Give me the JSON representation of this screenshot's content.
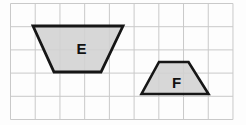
{
  "figure": {
    "background_color": "#fdfdfd",
    "width": 246,
    "height": 125,
    "grid": {
      "line_color": "#c9c9c9",
      "line_width": 1,
      "x0": 10.5,
      "y0": 3.5,
      "cols": 9,
      "rows": 5,
      "cell_width": 24.72,
      "cell_height": 23.2
    },
    "label_color": "#121212",
    "label_font_size": 15,
    "shapes": [
      {
        "id": "trapezoid-E",
        "label": "E",
        "points": "33,26 123,26 101,72 54,72",
        "label_x": 81.5,
        "label_y": 54,
        "fill": "#d2d2d2",
        "fill_opacity": 0.88,
        "stroke": "#161616",
        "stroke_width": 2.8
      },
      {
        "id": "trapezoid-F",
        "label": "F",
        "points": "159,62 188.5,62 208.5,94 141.5,94",
        "label_x": 176.5,
        "label_y": 87.5,
        "fill": "#d2d2d2",
        "fill_opacity": 0.88,
        "stroke": "#161616",
        "stroke_width": 2.6
      }
    ]
  }
}
